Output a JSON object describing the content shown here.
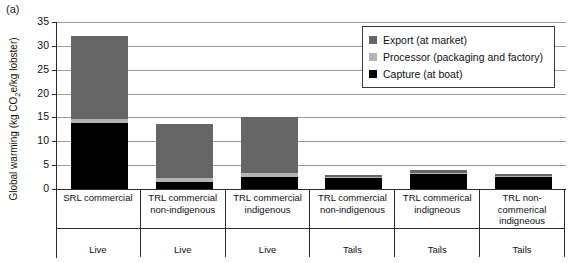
{
  "panel": {
    "label": "(a)"
  },
  "axes": {
    "ylabel_prefix": "Global warming (kg CO",
    "ylabel_sub": "2",
    "ylabel_suffix": "e/kg lobster)"
  },
  "legend": {
    "items": [
      {
        "label": "Export (at market)",
        "color": "#666666"
      },
      {
        "label": "Processor (packaging and factory)",
        "color": "#b4b4b4"
      },
      {
        "label": "Capture (at boat)",
        "color": "#000000"
      }
    ]
  },
  "chart_data": {
    "type": "bar",
    "title": "",
    "xlabel": "",
    "ylabel": "Global warming (kg CO2e/kg lobster)",
    "ylim": [
      0,
      35
    ],
    "yticks": [
      0,
      5,
      10,
      15,
      20,
      25,
      30,
      35
    ],
    "ytick_labels": [
      "0",
      "5",
      "10",
      "15",
      "20",
      "25",
      "30",
      "35"
    ],
    "grid": true,
    "stacked": true,
    "legend_position": "top-right",
    "categories": [
      "SRL commercial",
      "TRL commercial non-indigenous",
      "TRL commercial indigenous",
      "TRL commercial non-indigenous",
      "TRL commerical indigneous",
      "TRL non-commerical indigneous"
    ],
    "category_lines": [
      [
        "SRL commercial"
      ],
      [
        "TRL commercial",
        "non-indigenous"
      ],
      [
        "TRL commercial",
        "indigenous"
      ],
      [
        "TRL commercial",
        "non-indigenous"
      ],
      [
        "TRL commerical",
        "indigneous"
      ],
      [
        "TRL non-",
        "commerical",
        "indigneous"
      ]
    ],
    "groups": [
      "Live",
      "Live",
      "Live",
      "Tails",
      "Tails",
      "Tails"
    ],
    "series": [
      {
        "name": "Capture (at boat)",
        "color": "#000000",
        "values": [
          13.9,
          1.5,
          2.6,
          2.4,
          3.2,
          2.6
        ]
      },
      {
        "name": "Processor (packaging and factory)",
        "color": "#b4b4b4",
        "values": [
          0.7,
          0.9,
          0.7,
          0.1,
          0.1,
          0.1
        ]
      },
      {
        "name": "Export (at market)",
        "color": "#666666",
        "values": [
          17.5,
          11.3,
          11.7,
          0.4,
          0.6,
          0.5
        ]
      }
    ],
    "totals": [
      32.1,
      13.7,
      15.0,
      2.9,
      3.9,
      3.2
    ]
  }
}
